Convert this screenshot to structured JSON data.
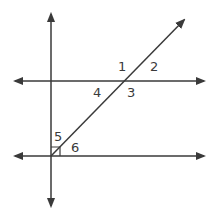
{
  "diagram": {
    "type": "geometry-angles",
    "line_color": "#3a3a3a",
    "labels": [
      "1",
      "2",
      "3",
      "4",
      "5",
      "6"
    ],
    "right_angle_marker": true
  }
}
